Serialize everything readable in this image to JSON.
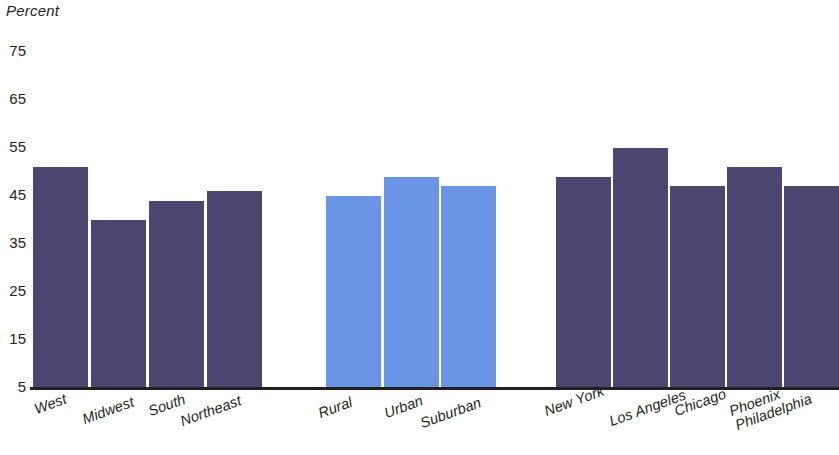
{
  "chart_data": {
    "type": "bar",
    "title": "",
    "xlabel": "",
    "ylabel": "Percent",
    "ylim": [
      5,
      75
    ],
    "yticks": [
      75,
      65,
      55,
      45,
      35,
      25,
      15,
      5
    ],
    "grid": false,
    "legend": "none",
    "groups": [
      {
        "name": "Region",
        "color": "#4a4670",
        "categories": [
          "West",
          "Midwest",
          "South",
          "Northeast"
        ],
        "values": [
          51,
          40,
          44,
          46
        ]
      },
      {
        "name": "Community type",
        "color": "#6a95e6",
        "categories": [
          "Rural",
          "Urban",
          "Suburban"
        ],
        "values": [
          45,
          49,
          47
        ]
      },
      {
        "name": "City",
        "color": "#4a4670",
        "categories": [
          "New York",
          "Los Angeles",
          "Chicago",
          "Phoenix",
          "Philadelphia"
        ],
        "values": [
          49,
          55,
          47,
          51,
          47
        ]
      }
    ],
    "categories": [
      "West",
      "Midwest",
      "South",
      "Northeast",
      "Rural",
      "Urban",
      "Suburban",
      "New York",
      "Los Angeles",
      "Chicago",
      "Phoenix",
      "Philadelphia"
    ],
    "values": [
      51,
      40,
      44,
      46,
      45,
      49,
      47,
      49,
      55,
      47,
      51,
      47
    ],
    "colors": [
      "#4a4670",
      "#4a4670",
      "#4a4670",
      "#4a4670",
      "#6a95e6",
      "#6a95e6",
      "#6a95e6",
      "#4a4670",
      "#4a4670",
      "#4a4670",
      "#4a4670",
      "#4a4670"
    ]
  },
  "axis": {
    "y_title": "Percent",
    "ticks": [
      "75",
      "65",
      "55",
      "45",
      "35",
      "25",
      "15",
      "5"
    ]
  },
  "bar_labels": [
    "West",
    "Midwest",
    "South",
    "Northeast",
    "Rural",
    "Urban",
    "Suburban",
    "New York",
    "Los Angeles",
    "Chicago",
    "Phoenix",
    "Philadelphia"
  ]
}
